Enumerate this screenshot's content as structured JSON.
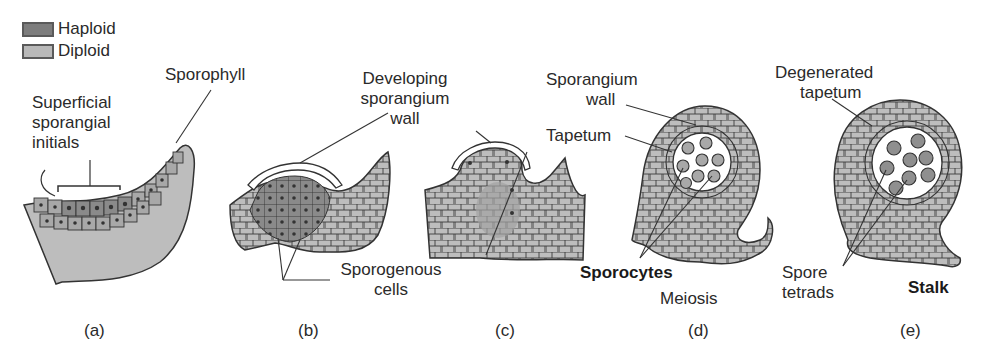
{
  "legend": {
    "items": [
      {
        "label": "Haploid",
        "color": "#7d7d7d"
      },
      {
        "label": "Diploid",
        "color": "#b9b9b9"
      }
    ]
  },
  "colors": {
    "haploid": "#7d7d7d",
    "diploid": "#bdbdbd",
    "cell_wall": "#333333",
    "background": "#ffffff"
  },
  "panels": [
    {
      "id": "a",
      "caption": "(a)",
      "labels": [
        "Superficial sporangial initials",
        "Sporophyll"
      ]
    },
    {
      "id": "b",
      "caption": "(b)",
      "labels": [
        "Developing sporangium wall",
        "Sporogenous cells"
      ]
    },
    {
      "id": "c",
      "caption": "(c)",
      "labels": [
        "Developing sporangium wall",
        "Sporogenous cells"
      ]
    },
    {
      "id": "d",
      "caption": "(d)",
      "labels": [
        "Sporangium wall",
        "Tapetum",
        "Sporocytes",
        "Meiosis"
      ]
    },
    {
      "id": "e",
      "caption": "(e)",
      "labels": [
        "Degenerated tapetum",
        "Spore tetrads",
        "Stalk"
      ]
    }
  ],
  "text": {
    "superficial_1": "Superficial",
    "superficial_2": "sporangial",
    "superficial_3": "initials",
    "sporophyll": "Sporophyll",
    "developing_1": "Developing",
    "developing_2": "sporangium",
    "developing_3": "wall",
    "sporogenous_1": "Sporogenous",
    "sporogenous_2": "cells",
    "sporangium_wall_1": "Sporangium",
    "sporangium_wall_2": "wall",
    "tapetum": "Tapetum",
    "sporocytes": "Sporocytes",
    "meiosis": "Meiosis",
    "degenerated_1": "Degenerated",
    "degenerated_2": "tapetum",
    "spore_1": "Spore",
    "spore_2": "tetrads",
    "stalk": "Stalk",
    "cap_a": "(a)",
    "cap_b": "(b)",
    "cap_c": "(c)",
    "cap_d": "(d)",
    "cap_e": "(e)"
  }
}
